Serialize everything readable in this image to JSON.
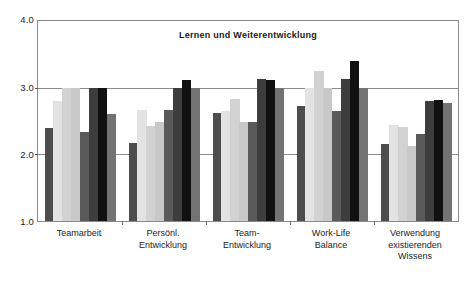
{
  "chart_data": {
    "type": "bar",
    "title": "Lernen und Weiterentwicklung",
    "xlabel": "",
    "ylabel": "",
    "ylim": [
      1.0,
      4.0
    ],
    "ytick_labels": [
      "4.0",
      "3.0",
      "2.0",
      "1.0"
    ],
    "ytick_values": [
      4.0,
      3.0,
      2.0,
      1.0
    ],
    "grid": true,
    "gridlines_at": [
      3.0,
      2.0
    ],
    "legend": "none",
    "legend_position": "none",
    "bars_per_group": 8,
    "categories": [
      "Teamarbeit",
      "Persönl. Entwicklung",
      "Team- Entwicklung",
      "Work-Life Balance",
      "Verwendung existierenden Wissens"
    ],
    "category_lines": [
      [
        "Teamarbeit"
      ],
      [
        "Persönl.",
        "Entwicklung"
      ],
      [
        "Team-",
        "Entwicklung"
      ],
      [
        "Work-Life",
        "Balance"
      ],
      [
        "Verwendung",
        "existierenden",
        "Wissens"
      ]
    ],
    "series": [
      {
        "name": "Serie 1",
        "color": "#4d4d4d",
        "values": [
          2.4,
          2.17,
          2.62,
          2.72,
          2.15
        ]
      },
      {
        "name": "Serie 2",
        "color": "#e3e3e3",
        "values": [
          2.8,
          2.66,
          2.65,
          3.0,
          2.44
        ]
      },
      {
        "name": "Serie 3",
        "color": "#d2d2d2",
        "values": [
          3.0,
          2.42,
          2.83,
          3.25,
          2.41
        ]
      },
      {
        "name": "Serie 4",
        "color": "#c9c9c9",
        "values": [
          3.0,
          2.48,
          2.48,
          3.0,
          2.13
        ]
      },
      {
        "name": "Serie 5",
        "color": "#5a5a5a",
        "values": [
          2.33,
          2.66,
          2.48,
          2.65,
          2.3
        ]
      },
      {
        "name": "Serie 6",
        "color": "#3d3d3d",
        "values": [
          3.0,
          3.0,
          3.13,
          3.13,
          2.8
        ]
      },
      {
        "name": "Serie 7",
        "color": "#111111",
        "values": [
          3.0,
          3.11,
          3.11,
          3.4,
          2.82
        ]
      },
      {
        "name": "Serie 8",
        "color": "#737373",
        "values": [
          2.6,
          3.0,
          3.0,
          3.0,
          2.77
        ]
      }
    ]
  },
  "axis": {
    "y_top_label": "4.0",
    "y_mid_high_label": "3.0",
    "y_mid_low_label": "2.0",
    "y_bottom_label": "1.0"
  },
  "colors": {
    "axis": "#8a8a8a",
    "text": "#1a1a1a",
    "background": "#ffffff"
  }
}
